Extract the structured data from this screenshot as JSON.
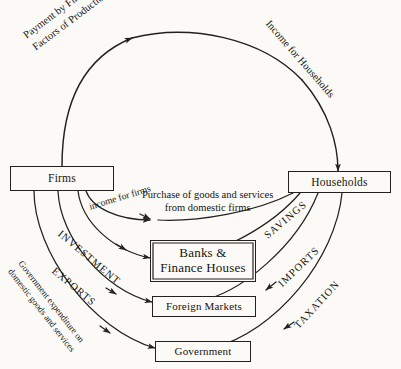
{
  "diagram": {
    "type": "economic-circular-flow",
    "background_color": "#fbfaf6",
    "line_color": "#23211e",
    "text_color": "#17150f"
  },
  "nodes": {
    "firms": {
      "label": "Firms"
    },
    "households": {
      "label": "Households"
    },
    "banks": {
      "label": "Banks &\nFinance Houses"
    },
    "foreign_markets": {
      "label": "Foreign Markets"
    },
    "government": {
      "label": "Government"
    }
  },
  "flow_labels": {
    "payment_for_factors": "Payment by Firms for\nFactors of Production",
    "income_for_households": "Income for Households",
    "purchase_goods_services": "Purchase of goods and services\nfrom domestic firms",
    "income_for_firms": "income for firms",
    "investment": "INVESTMENT",
    "exports": "EXPORTS",
    "government_expenditure": "Government expenditure on\ndomestic goods and services",
    "savings": "SAVINGS",
    "imports": "IMPORTS",
    "taxation": "TAXATION"
  }
}
